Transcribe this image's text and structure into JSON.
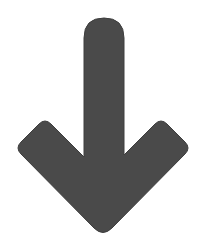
{
  "icon": {
    "name": "arrow-down-icon",
    "fill_color": "#4a4a4a",
    "background_color": "#ffffff"
  }
}
